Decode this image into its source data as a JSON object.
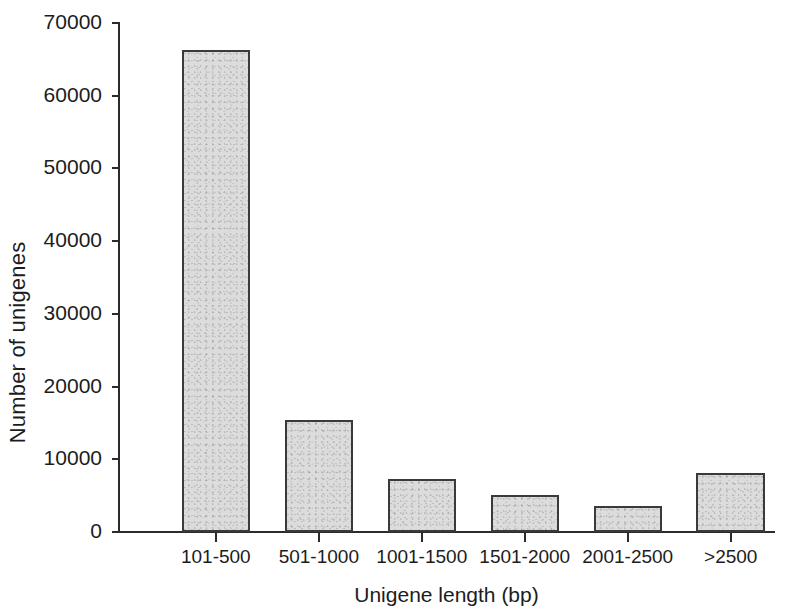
{
  "chart_data": {
    "type": "bar",
    "title": "",
    "subtitle": "",
    "xlabel": "Unigene length (bp)",
    "ylabel": "Number of unigenes",
    "categories": [
      "101-500",
      "501-1000",
      "1001-1500",
      "1501-2000",
      "2001-2500",
      ">2500"
    ],
    "values": [
      66300,
      15400,
      7300,
      5100,
      3600,
      8100
    ],
    "series": [
      {
        "name": "Number of unigenes",
        "values": [
          66300,
          15400,
          7300,
          5100,
          3600,
          8100
        ]
      }
    ],
    "ylim": [
      0,
      70000
    ],
    "yticks": [
      0,
      10000,
      20000,
      30000,
      40000,
      50000,
      60000,
      70000
    ],
    "ytick_labels": [
      "0",
      "10000",
      "20000",
      "30000",
      "40000",
      "50000",
      "60000",
      "70000"
    ],
    "grid": false,
    "legend": false,
    "legend_position": "none",
    "bar_fill_color": "#dcdcdc",
    "bar_border_color": "#3a3a3a",
    "axis_color": "#2b2b2b",
    "background_color": "#ffffff"
  }
}
